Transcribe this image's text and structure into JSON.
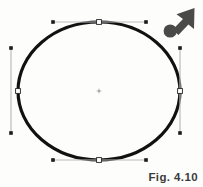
{
  "figure": {
    "caption": "Fig. 4.10",
    "background_color": "#fdfdfc",
    "width": 203,
    "height": 187
  },
  "shape": {
    "name": "ellipse",
    "state": "selected",
    "stroke_color": "#111111",
    "stroke_width": 3.2,
    "fill_color": "none",
    "center": {
      "x": 99,
      "y": 91
    },
    "radius_x": 81,
    "radius_y": 69
  },
  "center_marker": {
    "label": "center point",
    "color": "#b9b9b9",
    "x": 99,
    "y": 91,
    "size": 5
  },
  "anchors": [
    {
      "label": "top-anchor",
      "x": 99,
      "y": 22,
      "fill": "#ffffff",
      "stroke": "#222222"
    },
    {
      "label": "right-anchor",
      "x": 180,
      "y": 91,
      "fill": "#ffffff",
      "stroke": "#222222"
    },
    {
      "label": "bottom-anchor",
      "x": 99,
      "y": 160,
      "fill": "#ffffff",
      "stroke": "#222222"
    },
    {
      "label": "left-anchor",
      "x": 18,
      "y": 91,
      "fill": "#ffffff",
      "stroke": "#222222"
    }
  ],
  "handles": [
    {
      "label": "top-handle",
      "orientation": "horizontal",
      "line_color": "#bcbcbc",
      "dot_color": "#1b1b1b",
      "anchor": {
        "x": 99,
        "y": 22
      },
      "start": {
        "x": 53,
        "y": 22
      },
      "end": {
        "x": 146,
        "y": 22
      }
    },
    {
      "label": "right-handle",
      "orientation": "vertical",
      "line_color": "#bcbcbc",
      "dot_color": "#1b1b1b",
      "anchor": {
        "x": 180,
        "y": 91
      },
      "start": {
        "x": 180,
        "y": 48
      },
      "end": {
        "x": 180,
        "y": 133
      }
    },
    {
      "label": "bottom-handle",
      "orientation": "horizontal",
      "line_color": "#bcbcbc",
      "dot_color": "#1b1b1b",
      "anchor": {
        "x": 99,
        "y": 160
      },
      "start": {
        "x": 53,
        "y": 160
      },
      "end": {
        "x": 146,
        "y": 160
      }
    },
    {
      "label": "left-handle",
      "orientation": "vertical",
      "line_color": "#bcbcbc",
      "dot_color": "#1b1b1b",
      "anchor": {
        "x": 18,
        "y": 91
      },
      "start": {
        "x": 11,
        "y": 48
      },
      "end": {
        "x": 11,
        "y": 133
      }
    }
  ],
  "cursor": {
    "label": "arrow cursor pointing up-right",
    "color": "#4a4a4a",
    "tip": {
      "x": 194,
      "y": 9
    },
    "base": {
      "x": 165,
      "y": 33
    }
  }
}
